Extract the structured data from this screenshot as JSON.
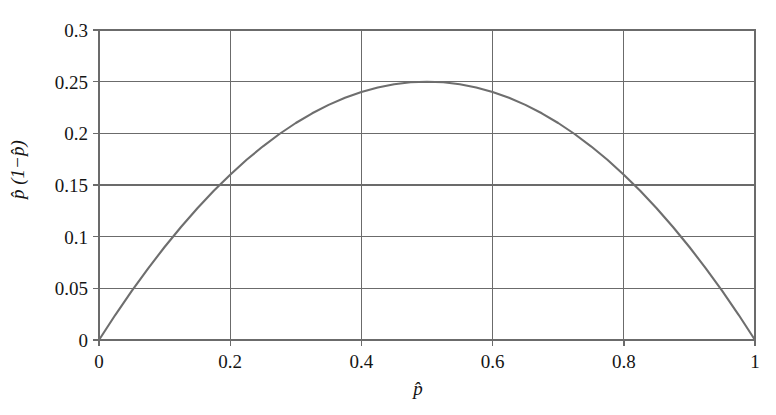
{
  "figure": {
    "background_color": "#ffffff",
    "axis_color": "#6b6b6b",
    "curve_color": "#6e6e6e",
    "grid_color": "#6b6b6b",
    "text_color": "#151515"
  },
  "axis": {
    "x_title": "p̂",
    "y_title": "p̂ (1−p̂)",
    "x_ticks": [
      "0",
      "0.2",
      "0.4",
      "0.6",
      "0.8",
      "1"
    ],
    "y_ticks": [
      "0",
      "0.05",
      "0.1",
      "0.15",
      "0.2",
      "0.25",
      "0.3"
    ]
  },
  "chart_data": {
    "type": "line",
    "title": "",
    "subtitle": "",
    "xlabel": "p̂",
    "ylabel": "p̂ (1−p̂)",
    "xlim": [
      0,
      1
    ],
    "ylim": [
      0,
      0.3
    ],
    "xticks": [
      0,
      0.2,
      0.4,
      0.6,
      0.8,
      1
    ],
    "yticks": [
      0,
      0.05,
      0.1,
      0.15,
      0.2,
      0.25,
      0.3
    ],
    "grid": true,
    "legend": "none",
    "annotations": [],
    "series": [
      {
        "name": "p̂(1−p̂)",
        "color": "#6e6e6e",
        "x": [
          0,
          0.025,
          0.05,
          0.075,
          0.1,
          0.125,
          0.15,
          0.175,
          0.2,
          0.225,
          0.25,
          0.275,
          0.3,
          0.325,
          0.35,
          0.375,
          0.4,
          0.425,
          0.45,
          0.475,
          0.5,
          0.525,
          0.55,
          0.575,
          0.6,
          0.625,
          0.65,
          0.675,
          0.7,
          0.725,
          0.75,
          0.775,
          0.8,
          0.825,
          0.85,
          0.875,
          0.9,
          0.925,
          0.95,
          0.975,
          1
        ],
        "y": [
          0,
          0.024375,
          0.0475,
          0.069375,
          0.09,
          0.109375,
          0.1275,
          0.144375,
          0.16,
          0.174375,
          0.1875,
          0.199375,
          0.21,
          0.219375,
          0.2275,
          0.234375,
          0.24,
          0.244375,
          0.2475,
          0.249375,
          0.25,
          0.249375,
          0.2475,
          0.244375,
          0.24,
          0.234375,
          0.2275,
          0.219375,
          0.21,
          0.199375,
          0.1875,
          0.174375,
          0.16,
          0.144375,
          0.1275,
          0.109375,
          0.09,
          0.069375,
          0.0475,
          0.024375,
          0
        ]
      }
    ]
  }
}
